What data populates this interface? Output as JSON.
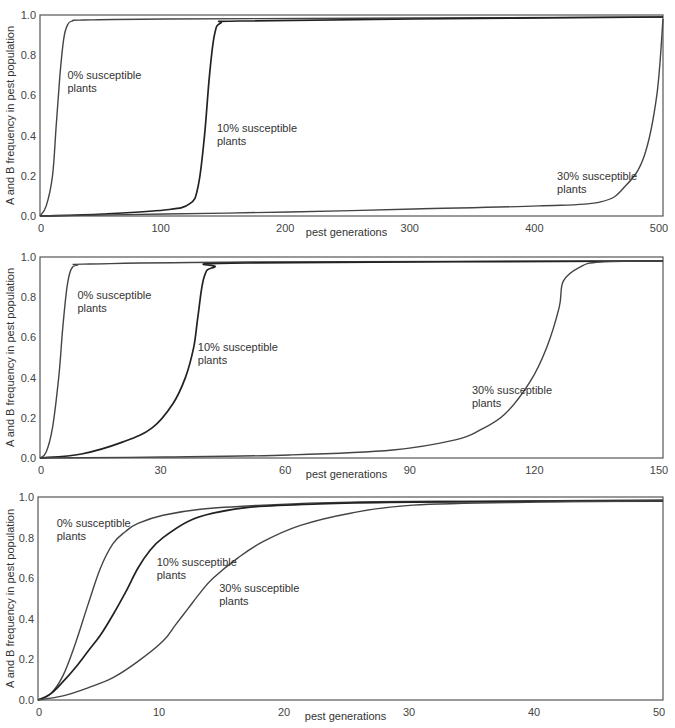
{
  "chart_data": [
    {
      "type": "line",
      "title": "",
      "xlabel": "pest generations",
      "ylabel": "A and B frequency in pest population",
      "xlim": [
        0,
        500
      ],
      "ylim": [
        0,
        1.0
      ],
      "xticks": [
        "0",
        "100",
        "200",
        "300",
        "400",
        "500"
      ],
      "yticks": [
        "0.0",
        "0.2",
        "0.4",
        "0.6",
        "0.8",
        "1.0"
      ],
      "grid": false,
      "legend": "inline annotations",
      "series": [
        {
          "name": "0% susceptible plants",
          "x": [
            0,
            5,
            10,
            13,
            16,
            19,
            22,
            26,
            35,
            100,
            300,
            500
          ],
          "y": [
            0,
            0.05,
            0.2,
            0.45,
            0.7,
            0.88,
            0.95,
            0.97,
            0.975,
            0.98,
            0.985,
            0.99
          ]
        },
        {
          "name": "10% susceptible plants",
          "x": [
            0,
            50,
            100,
            120,
            127,
            132,
            136,
            140,
            145,
            160,
            300,
            500
          ],
          "y": [
            0,
            0.01,
            0.03,
            0.06,
            0.15,
            0.4,
            0.7,
            0.9,
            0.96,
            0.97,
            0.98,
            0.99
          ]
        },
        {
          "name": "30% susceptible plants",
          "x": [
            0,
            100,
            200,
            300,
            400,
            450,
            470,
            485,
            495,
            500
          ],
          "y": [
            0,
            0.01,
            0.02,
            0.035,
            0.05,
            0.07,
            0.15,
            0.3,
            0.6,
            0.98
          ]
        }
      ],
      "annotations": [
        {
          "text": [
            "0% susceptible",
            "plants"
          ],
          "x": 22,
          "y": 0.68
        },
        {
          "text": [
            "10% susceptible",
            "plants"
          ],
          "x": 142,
          "y": 0.42
        },
        {
          "text": [
            "30% susceptible",
            "plants"
          ],
          "x": 415,
          "y": 0.18
        }
      ]
    },
    {
      "type": "line",
      "title": "",
      "xlabel": "pest generations",
      "ylabel": "A and B frequency in pest population",
      "xlim": [
        0,
        150
      ],
      "ylim": [
        0,
        1.0
      ],
      "xticks": [
        "0",
        "30",
        "60",
        "90",
        "120",
        "150"
      ],
      "yticks": [
        "0.0",
        "0.2",
        "0.4",
        "0.6",
        "0.8",
        "1.0"
      ],
      "grid": false,
      "legend": "inline annotations",
      "series": [
        {
          "name": "0% susceptible plants",
          "x": [
            0,
            1.5,
            3,
            4.5,
            5.5,
            6.5,
            7.5,
            9,
            12,
            50,
            150
          ],
          "y": [
            0,
            0.03,
            0.15,
            0.4,
            0.65,
            0.85,
            0.94,
            0.96,
            0.965,
            0.975,
            0.98
          ]
        },
        {
          "name": "10% susceptible plants",
          "x": [
            0,
            10,
            20,
            27,
            32,
            35,
            37,
            38,
            39.5,
            42,
            50,
            150
          ],
          "y": [
            0,
            0.02,
            0.08,
            0.15,
            0.27,
            0.4,
            0.55,
            0.7,
            0.9,
            0.95,
            0.97,
            0.98
          ]
        },
        {
          "name": "30% susceptible plants",
          "x": [
            0,
            30,
            60,
            85,
            100,
            106,
            112,
            118,
            122,
            125,
            126,
            130,
            135,
            150
          ],
          "y": [
            0,
            0.005,
            0.015,
            0.04,
            0.09,
            0.14,
            0.22,
            0.38,
            0.55,
            0.75,
            0.88,
            0.95,
            0.975,
            0.98
          ]
        }
      ],
      "annotations": [
        {
          "text": [
            "0% susceptible",
            "plants"
          ],
          "x": 9,
          "y": 0.79
        },
        {
          "text": [
            "10% susceptible",
            "plants"
          ],
          "x": 38,
          "y": 0.53
        },
        {
          "text": [
            "30% susceptible",
            "plants"
          ],
          "x": 104,
          "y": 0.32
        }
      ]
    },
    {
      "type": "line",
      "title": "",
      "xlabel": "pest generations",
      "ylabel": "A and B frequency in pest population",
      "xlim": [
        0,
        50
      ],
      "ylim": [
        0,
        1.0
      ],
      "xticks": [
        "0",
        "10",
        "20",
        "30",
        "40",
        "50"
      ],
      "yticks": [
        "0.0",
        "0.2",
        "0.4",
        "0.6",
        "0.8",
        "1.0"
      ],
      "grid": false,
      "legend": "inline annotations",
      "series": [
        {
          "name": "0% susceptible plants",
          "x": [
            0,
            1,
            2,
            3,
            4,
            5,
            6,
            7,
            8,
            10,
            13,
            18,
            25,
            35,
            50
          ],
          "y": [
            0,
            0.03,
            0.12,
            0.28,
            0.47,
            0.65,
            0.77,
            0.83,
            0.87,
            0.91,
            0.94,
            0.96,
            0.975,
            0.98,
            0.985
          ]
        },
        {
          "name": "10% susceptible plants",
          "x": [
            0,
            1,
            2,
            3,
            4,
            5,
            6,
            7,
            8,
            9,
            10,
            12,
            14,
            17,
            22,
            30,
            50
          ],
          "y": [
            0,
            0.03,
            0.09,
            0.16,
            0.24,
            0.32,
            0.42,
            0.53,
            0.65,
            0.74,
            0.8,
            0.88,
            0.92,
            0.95,
            0.965,
            0.975,
            0.98
          ]
        },
        {
          "name": "30% susceptible plants",
          "x": [
            0,
            2,
            4,
            6,
            8,
            10,
            11,
            12,
            13,
            14,
            16,
            18,
            21,
            25,
            30,
            40,
            50
          ],
          "y": [
            0,
            0.02,
            0.06,
            0.11,
            0.19,
            0.29,
            0.37,
            0.45,
            0.53,
            0.6,
            0.7,
            0.78,
            0.86,
            0.92,
            0.96,
            0.975,
            0.98
          ]
        }
      ],
      "annotations": [
        {
          "text": [
            "0% susceptible",
            "plants"
          ],
          "x": 1.5,
          "y": 0.85
        },
        {
          "text": [
            "10% susceptible",
            "plants"
          ],
          "x": 9.5,
          "y": 0.66
        },
        {
          "text": [
            "30% susceptible",
            "plants"
          ],
          "x": 14.5,
          "y": 0.53
        }
      ]
    }
  ],
  "layout": [
    {
      "left": 40,
      "right": 663,
      "top": 15,
      "bottom": 216
    },
    {
      "left": 40,
      "right": 663,
      "top": 257,
      "bottom": 458
    },
    {
      "left": 38,
      "right": 663,
      "top": 497,
      "bottom": 700
    }
  ],
  "colors": {
    "axis": "#555555",
    "curve": "#444444",
    "curve_dark": "#222222",
    "text": "#333333"
  }
}
